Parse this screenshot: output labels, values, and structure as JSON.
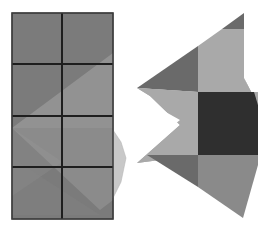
{
  "figure": {
    "colors": {
      "background": "#ffffff",
      "grid_fill": "#7b7b7b",
      "grid_line": "#1e1e1e",
      "overlay_light": "#a6a6a6",
      "tab_light": "#c8c8c8",
      "dark_triangle": "#6a6a6a",
      "light_gray": "#a9a9a9",
      "dark_square": "#2f2f2f",
      "mid_gray": "#8a8a8a"
    },
    "left_panel": {
      "rows": 4,
      "cols": 2,
      "x": 12,
      "y": 13,
      "width": 101,
      "height": 206
    },
    "right_panel": {
      "pieces": 7
    }
  }
}
